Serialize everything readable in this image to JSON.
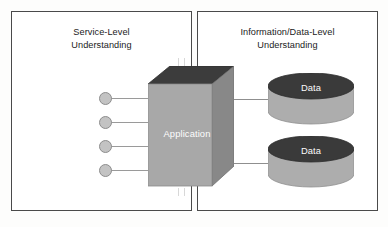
{
  "diagram": {
    "panels": [
      {
        "id": "service",
        "title": "Service-Level\nUnderstanding",
        "title_line1": "Service-Level",
        "title_line2": "Understanding"
      },
      {
        "id": "data",
        "title": "Information/Data-Level\nUnderstanding",
        "title_line1": "Information/Data-Level",
        "title_line2": "Understanding"
      }
    ],
    "application": {
      "label": "Application",
      "shape": "3d-cube",
      "face_front_color": "#a8a8a8",
      "face_side_color": "#888888",
      "face_top_color": "#3c3c3c"
    },
    "datastores": [
      {
        "label": "Data",
        "shape": "cylinder",
        "top_color": "#3a3a3a",
        "body_color": "#adadad"
      },
      {
        "label": "Data",
        "shape": "cylinder",
        "top_color": "#3a3a3a",
        "body_color": "#adadad"
      }
    ],
    "service_interfaces": [
      {
        "index": 1,
        "shape": "lollipop-circle"
      },
      {
        "index": 2,
        "shape": "lollipop-circle"
      },
      {
        "index": 3,
        "shape": "lollipop-circle"
      },
      {
        "index": 4,
        "shape": "lollipop-circle"
      }
    ],
    "colors": {
      "panel_border": "#4a4a4a",
      "connector_line": "#9a9a9a",
      "interface_fill": "#c3c3c3",
      "interface_border": "#8d8d8d",
      "background": "#ffffff",
      "label_text": "#1b1b1b",
      "shape_text": "#fdfdfd"
    }
  }
}
